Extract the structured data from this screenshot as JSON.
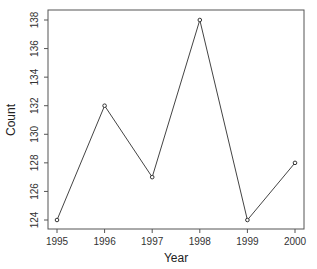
{
  "chart_data": {
    "type": "line",
    "title": "",
    "xlabel": "Year",
    "ylabel": "Count",
    "x": [
      1995,
      1996,
      1997,
      1998,
      1999,
      2000
    ],
    "series": [
      {
        "name": "Count",
        "values": [
          124,
          132,
          127,
          138,
          124,
          128
        ]
      }
    ],
    "x_ticks": [
      "1995",
      "1996",
      "1997",
      "1998",
      "1999",
      "2000"
    ],
    "y_ticks": [
      "124",
      "126",
      "128",
      "130",
      "132",
      "134",
      "136",
      "138"
    ],
    "xlim": [
      1995,
      2000
    ],
    "ylim": [
      124,
      138
    ],
    "grid": false,
    "legend": null,
    "markers": "open-circle",
    "colors": {
      "line": "#444444",
      "axis": "#555555",
      "text": "#333333"
    }
  }
}
